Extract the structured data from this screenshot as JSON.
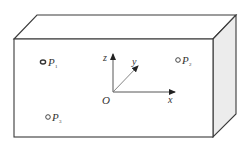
{
  "diagram": {
    "type": "3d-box-with-coordinate-axes",
    "colors": {
      "stroke": "#3a3a3a",
      "side_face": "#ececec",
      "front_face": "#ffffff",
      "text": "#333333"
    },
    "box": {
      "front": {
        "x1": 14,
        "y1": 39,
        "x2": 213,
        "y2": 137
      },
      "depth_offset": {
        "dx": 23,
        "dy": -24
      }
    },
    "axes": {
      "origin": {
        "label": "O",
        "x": 113,
        "y": 92
      },
      "x_axis": {
        "label": "x",
        "to": {
          "x": 175,
          "y": 92
        }
      },
      "y_axis": {
        "label": "y",
        "to": {
          "x": 138,
          "y": 66
        }
      },
      "z_axis": {
        "label": "z",
        "to": {
          "x": 113,
          "y": 54
        }
      }
    },
    "points": [
      {
        "name": "P",
        "subscript": "1",
        "x": 43,
        "y": 62
      },
      {
        "name": "P",
        "subscript": "2",
        "x": 178,
        "y": 60
      },
      {
        "name": "P",
        "subscript": "3",
        "x": 48,
        "y": 117
      }
    ]
  }
}
